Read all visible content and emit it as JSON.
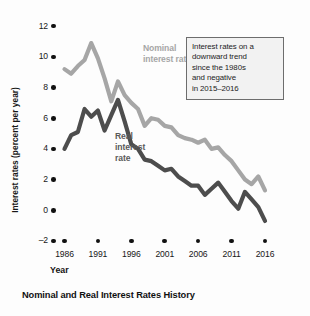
{
  "caption": "Nominal and Real Interest Rates History",
  "series_labels": {
    "nominal_line1": "Nominal",
    "nominal_line2": "interest rate",
    "real_line1": "Real",
    "real_line2": "interest",
    "real_line3": "rate"
  },
  "annotation": {
    "line1": "Interest rates on a",
    "line2": "downward trend",
    "line3": "since the 1980s",
    "line4": "and negative",
    "line5": "in 2015–2016"
  },
  "colors": {
    "nominal": "#a6a6a6",
    "real": "#4d4d4d",
    "axis": "#111111",
    "annotation_border": "#6d6d6d",
    "annotation_fill": "#f2f2f2",
    "background": "#fdfdfd"
  },
  "chart_data": {
    "type": "line",
    "title": "Nominal and Real Interest Rates History",
    "xlabel": "Year",
    "ylabel": "Interest rates (percent per year)",
    "xlim": [
      1986,
      2016
    ],
    "ylim": [
      -2,
      12
    ],
    "ytick_labels": [
      "12",
      "10",
      "8",
      "6",
      "4",
      "2",
      "0",
      "–2"
    ],
    "ytick_values": [
      12,
      10,
      8,
      6,
      4,
      2,
      0,
      -2
    ],
    "xtick_labels": [
      "1986",
      "1991",
      "1996",
      "2001",
      "2006",
      "2011",
      "2016"
    ],
    "xtick_values": [
      1986,
      1991,
      1996,
      2001,
      2006,
      2011,
      2016
    ],
    "grid": false,
    "legend": "inline-labels",
    "x": [
      1986,
      1987,
      1988,
      1989,
      1990,
      1991,
      1992,
      1993,
      1994,
      1995,
      1996,
      1997,
      1998,
      1999,
      2000,
      2001,
      2002,
      2003,
      2004,
      2005,
      2006,
      2007,
      2008,
      2009,
      2010,
      2011,
      2012,
      2013,
      2014,
      2015,
      2016
    ],
    "series": [
      {
        "name": "Nominal interest rate",
        "color": "#a6a6a6",
        "values": [
          9.2,
          8.9,
          9.4,
          9.8,
          10.9,
          9.9,
          8.6,
          7.1,
          8.4,
          7.5,
          7.0,
          6.6,
          5.5,
          6.0,
          5.9,
          5.5,
          5.4,
          4.9,
          4.7,
          4.6,
          4.4,
          4.6,
          4.0,
          4.1,
          3.6,
          3.2,
          2.6,
          2.0,
          1.7,
          2.2,
          1.3
        ]
      },
      {
        "name": "Real interest rate",
        "color": "#4d4d4d",
        "values": [
          4.0,
          4.9,
          5.1,
          6.6,
          6.1,
          6.5,
          5.2,
          6.2,
          7.2,
          5.8,
          4.3,
          4.0,
          3.3,
          3.2,
          2.9,
          2.6,
          2.7,
          2.2,
          1.9,
          1.6,
          1.6,
          1.0,
          1.4,
          1.8,
          1.2,
          0.6,
          0.1,
          1.2,
          0.7,
          0.2,
          -0.7
        ]
      }
    ]
  }
}
